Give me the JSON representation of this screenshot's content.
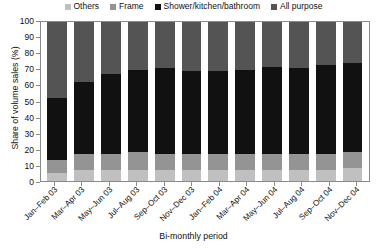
{
  "chart_data": {
    "type": "bar",
    "subtype": "100% stacked bar",
    "title": "",
    "xlabel": "Bi-monthly period",
    "ylabel": "Share of volume sales (%)",
    "ylim": [
      0,
      100
    ],
    "ytick_step": 10,
    "yticks": [
      100,
      90,
      80,
      70,
      60,
      50,
      40,
      30,
      20,
      10,
      0
    ],
    "grid": false,
    "legend_position": "top",
    "categories": [
      "Jan–Feb 03",
      "Mar–Apr 03",
      "May–Jun 03",
      "Jul–Aug 03",
      "Sep–Oct 03",
      "Nov–Dec 03",
      "Jan–Feb 04",
      "Mar–Apr 04",
      "May–Jun 04",
      "Jul–Aug 04",
      "Sep–Oct 04",
      "Nov–Dec 04"
    ],
    "series": [
      {
        "name": "Others",
        "color": "#c0c0c0",
        "values": [
          5,
          7,
          7,
          7,
          7,
          7,
          7,
          7,
          7,
          7,
          7,
          8
        ]
      },
      {
        "name": "Frame",
        "color": "#949494",
        "values": [
          8,
          10,
          10,
          11,
          10,
          10,
          10,
          10,
          10,
          10,
          10,
          10
        ]
      },
      {
        "name": "Shower/kitchen/bathroom",
        "color": "#111111",
        "values": [
          39,
          45,
          50,
          52,
          54,
          52,
          52,
          53,
          55,
          54,
          56,
          56
        ]
      },
      {
        "name": "All purpose",
        "color": "#545454",
        "values": [
          48,
          38,
          33,
          30,
          29,
          31,
          31,
          30,
          28,
          29,
          27,
          26
        ]
      }
    ],
    "stack_order_bottom_to_top": [
      "Others",
      "Frame",
      "Shower/kitchen/bathroom",
      "All purpose"
    ]
  },
  "legend": {
    "items": [
      {
        "label": "Others",
        "color": "#c0c0c0"
      },
      {
        "label": "Frame",
        "color": "#949494"
      },
      {
        "label": "Shower/kitchen/bathroom",
        "color": "#111111"
      },
      {
        "label": "All purpose",
        "color": "#545454"
      }
    ]
  },
  "axes": {
    "y_title": "Share of volume sales (%)",
    "x_title": "Bi-monthly period"
  }
}
